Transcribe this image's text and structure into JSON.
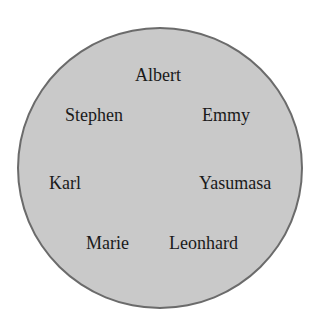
{
  "diagram": {
    "shape": "circle",
    "fill_color": "#c9c9c9",
    "border_color": "#6b6b6b",
    "names": [
      {
        "label": "Albert",
        "x": 135,
        "y": 66
      },
      {
        "label": "Stephen",
        "x": 65,
        "y": 106
      },
      {
        "label": "Emmy",
        "x": 202,
        "y": 106
      },
      {
        "label": "Karl",
        "x": 49,
        "y": 174
      },
      {
        "label": "Yasumasa",
        "x": 199,
        "y": 174
      },
      {
        "label": "Marie",
        "x": 86,
        "y": 234
      },
      {
        "label": "Leonhard",
        "x": 169,
        "y": 234
      }
    ]
  }
}
